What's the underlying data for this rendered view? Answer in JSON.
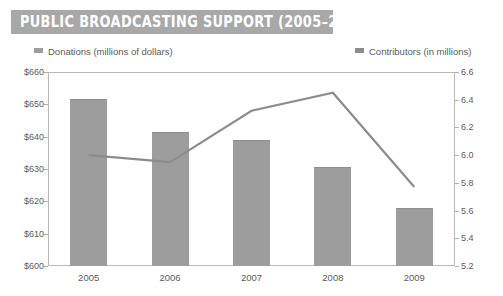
{
  "title": "PUBLIC BROADCASTING SUPPORT (2005–2009)",
  "colors": {
    "banner": "#a8a8a8",
    "bar": "#9d9d9d",
    "line": "#8c8c8e",
    "text": "#5a5a5c",
    "axis": "#b9b9b9",
    "background": "#ffffff"
  },
  "legend": [
    {
      "label": "Donations (millions of dollars)",
      "swatch_color": "#9d9d9d",
      "series": "bar"
    },
    {
      "label": "Contributors (in millions)",
      "swatch_color": "#8c8c8e",
      "series": "line"
    }
  ],
  "axes": {
    "left": {
      "ticks": [
        "$660",
        "$650",
        "$640",
        "$630",
        "$620",
        "$610",
        "$600"
      ],
      "min": 600,
      "max": 660,
      "step": 10
    },
    "right": {
      "ticks": [
        "6.6",
        "6.4",
        "6.2",
        "6.0",
        "5.8",
        "5.6",
        "5.4",
        "5.2"
      ],
      "min": 5.2,
      "max": 6.6,
      "step": 0.2
    },
    "x": {
      "ticks": [
        "2005",
        "2006",
        "2007",
        "2008",
        "2009"
      ]
    }
  },
  "chart_data": {
    "type": "bar",
    "title": "PUBLIC BROADCASTING SUPPORT (2005–2009)",
    "xlabel": "",
    "ylabel": "Donations (millions of dollars)",
    "y2label": "Contributors (in millions)",
    "categories": [
      "2005",
      "2006",
      "2007",
      "2008",
      "2009"
    ],
    "ylim": [
      600,
      660
    ],
    "y2lim": [
      5.2,
      6.6
    ],
    "grid": false,
    "legend_position": "top",
    "series": [
      {
        "name": "Donations (millions of dollars)",
        "type": "bar",
        "axis": "left",
        "color": "#9d9d9d",
        "values": [
          651.5,
          641.3,
          639.0,
          630.5,
          618.0
        ]
      },
      {
        "name": "Contributors (in millions)",
        "type": "line",
        "axis": "right",
        "color": "#8c8c8e",
        "values": [
          6.0,
          5.95,
          6.32,
          6.45,
          5.77
        ]
      }
    ]
  }
}
